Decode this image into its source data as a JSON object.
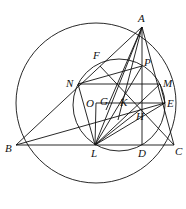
{
  "diagram": {
    "title": "",
    "points": {
      "A": {
        "label": "A",
        "x": 142,
        "y": 27
      },
      "B": {
        "label": "B",
        "x": 16,
        "y": 145
      },
      "C": {
        "label": "C",
        "x": 174,
        "y": 145
      },
      "D": {
        "label": "D",
        "x": 142,
        "y": 145
      },
      "L": {
        "label": "L",
        "x": 95,
        "y": 145
      },
      "N": {
        "label": "N",
        "x": 78,
        "y": 84
      },
      "M": {
        "label": "M",
        "x": 160,
        "y": 84
      },
      "E": {
        "label": "E",
        "x": 165,
        "y": 103
      },
      "H": {
        "label": "H",
        "x": 141,
        "y": 109
      },
      "O": {
        "label": "O",
        "x": 96,
        "y": 103
      },
      "G": {
        "label": "G",
        "x": 106,
        "y": 103
      },
      "K": {
        "label": "K",
        "x": 124,
        "y": 103
      },
      "P": {
        "label": "P",
        "x": 142,
        "y": 66
      },
      "F": {
        "label": "F",
        "x": 100,
        "y": 66
      }
    },
    "circles": [
      {
        "name": "circumcircle",
        "cx": 96,
        "cy": 100,
        "r": 80
      },
      {
        "name": "small-circle",
        "cx": 119,
        "cy": 105,
        "r": 46
      }
    ]
  }
}
